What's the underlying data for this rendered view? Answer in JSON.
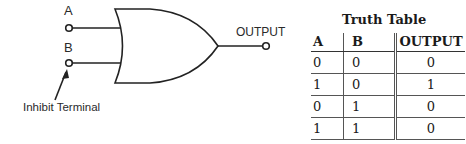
{
  "diagram": {
    "input_a_label": "A",
    "input_b_label": "B",
    "output_label": "OUTPUT",
    "inhibit_label": "Inhibit Terminal",
    "gate_type": "OR gate with inhibit terminal"
  },
  "truth_table": {
    "title": "Truth Table",
    "headers": [
      "A",
      "B",
      "OUTPUT"
    ],
    "rows": [
      [
        "0",
        "0",
        "0"
      ],
      [
        "1",
        "0",
        "1"
      ],
      [
        "0",
        "1",
        "0"
      ],
      [
        "1",
        "1",
        "0"
      ]
    ]
  }
}
